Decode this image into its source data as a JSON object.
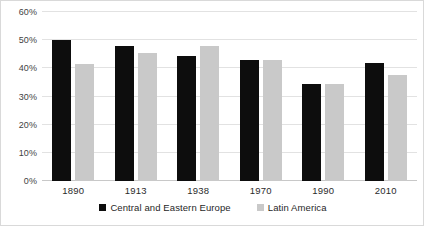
{
  "chart_data": {
    "type": "bar",
    "title": "",
    "subtitle": "",
    "xlabel": "",
    "ylabel": "",
    "categories": [
      "1890",
      "1913",
      "1938",
      "1970",
      "1990",
      "2010"
    ],
    "series": [
      {
        "name": "Central and Eastern Europe",
        "color": "#0d0d0d",
        "values": [
          50.0,
          48.0,
          44.5,
          43.0,
          34.5,
          42.0
        ]
      },
      {
        "name": "Latin America",
        "color": "#c9c9c9",
        "values": [
          41.5,
          45.5,
          48.0,
          43.0,
          34.5,
          37.5
        ]
      }
    ],
    "ylim": [
      0,
      60
    ],
    "ytick_values": [
      0,
      10,
      20,
      30,
      40,
      50,
      60
    ],
    "ytick_labels": [
      "0%",
      "10%",
      "20%",
      "30%",
      "40%",
      "50%",
      "60%"
    ],
    "grid": true,
    "grid_axis": "y",
    "legend_position": "bottom",
    "bar_orientation": "vertical",
    "value_suffix": "%"
  },
  "colors": {
    "series_0": "#0d0d0d",
    "series_1": "#c9c9c9",
    "gridline": "#e2e2e2",
    "baseline": "#c8c8c8",
    "frame": "#d9d9d9",
    "text": "#2b2b2b",
    "background": "#ffffff"
  }
}
